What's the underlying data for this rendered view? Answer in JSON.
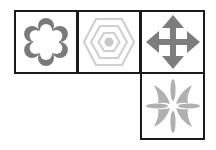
{
  "grid": {
    "cells": [
      {
        "row": 0,
        "col": 0,
        "icon": "flower-icon",
        "color": "#7a7a7a"
      },
      {
        "row": 0,
        "col": 1,
        "icon": "concentric-hexagon-icon",
        "color": "#cfcfcf"
      },
      {
        "row": 0,
        "col": 2,
        "icon": "move-arrows-icon",
        "color": "#7d7d7d"
      },
      {
        "row": 1,
        "col": 2,
        "icon": "star-burst-icon",
        "color": "#b0b0b0"
      }
    ],
    "border_color": "#1a1a1a"
  }
}
